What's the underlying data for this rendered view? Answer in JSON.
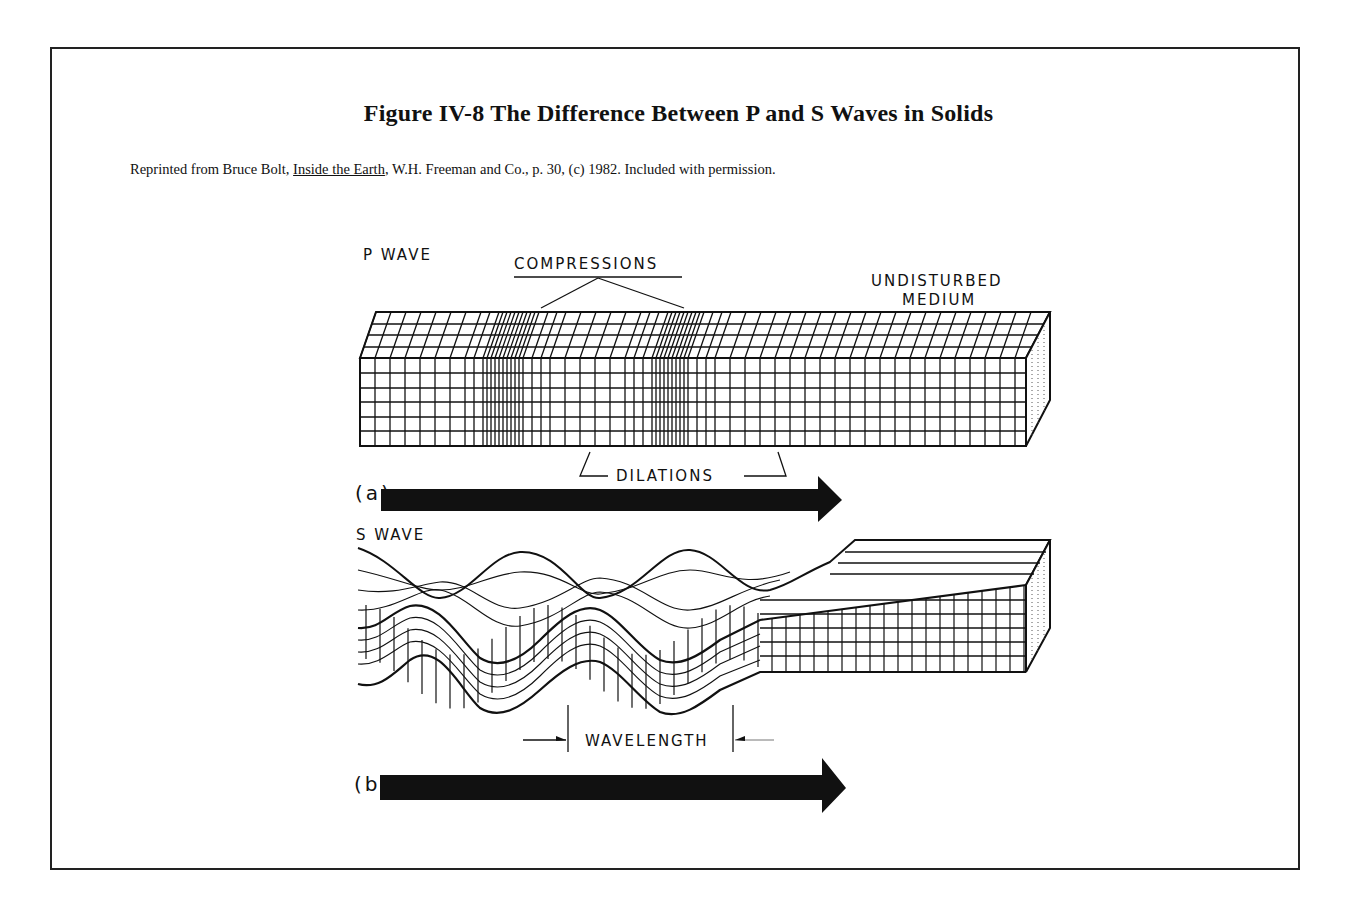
{
  "figure": {
    "title": "Figure IV-8  The Difference Between P and S Waves in Solids",
    "credit": {
      "prefix": "Reprinted from Bruce Bolt, ",
      "book": "Inside the Earth",
      "suffix": ", W.H. Freeman and Co., p. 30, (c) 1982. Included with permission."
    }
  },
  "panel_a": {
    "wave_label": "P  WAVE",
    "compressions_label": "COMPRESSIONS",
    "undisturbed_label_line1": "UNDISTURBED",
    "undisturbed_label_line2": "MEDIUM",
    "dilations_label": "DILATIONS",
    "panel_label": "(a)",
    "arrow": "direction-right-arrow"
  },
  "panel_b": {
    "wave_label": "S  WAVE",
    "wavelength_label": "WAVELENGTH",
    "panel_label": "(b)",
    "arrow": "direction-right-arrow"
  },
  "colors": {
    "ink": "#111111",
    "paper": "#ffffff"
  }
}
